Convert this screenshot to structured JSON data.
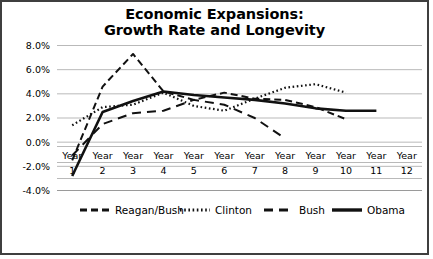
{
  "chart_data": {
    "type": "line",
    "title": "Economic Expansions: Growth Rate and Longevity",
    "title_line1": "Economic Expansions:",
    "title_line2": "Growth Rate and Longevity",
    "xlabel": "",
    "ylabel": "",
    "categories": [
      "Year 1",
      "Year 2",
      "Year 3",
      "Year 4",
      "Year 5",
      "Year 6",
      "Year 7",
      "Year 8",
      "Year 9",
      "Year 10",
      "Year 11",
      "Year 12"
    ],
    "x_tick_words": [
      "Year",
      "Year",
      "Year",
      "Year",
      "Year",
      "Year",
      "Year",
      "Year",
      "Year",
      "Year",
      "Year",
      "Year"
    ],
    "x_tick_numbers": [
      "1",
      "2",
      "3",
      "4",
      "5",
      "6",
      "7",
      "8",
      "9",
      "10",
      "11",
      "12"
    ],
    "ylim": [
      -4.0,
      8.0
    ],
    "ytick_values": [
      8.0,
      6.0,
      4.0,
      2.0,
      0.0,
      -2.0,
      -4.0
    ],
    "ytick_labels": [
      "8.0%",
      "6.0%",
      "4.0%",
      "2.0%",
      "0.0%",
      "-2.0%",
      "-4.0%"
    ],
    "grid": true,
    "legend_position": "bottom",
    "series": [
      {
        "name": "Reagan/Bush",
        "style": "dashed",
        "dash": "7,4",
        "width": 2,
        "x": [
          1,
          2,
          3,
          4,
          5,
          6,
          7,
          8,
          9,
          10
        ],
        "values": [
          -1.5,
          4.6,
          7.3,
          4.2,
          3.5,
          4.1,
          3.6,
          3.5,
          2.9,
          1.9
        ]
      },
      {
        "name": "Clinton",
        "style": "dotted",
        "dash": "1.6,2.6",
        "width": 2.2,
        "x": [
          1,
          2,
          3,
          4,
          5,
          6,
          7,
          8,
          9,
          10
        ],
        "values": [
          1.4,
          2.9,
          3.1,
          4.1,
          3.0,
          2.6,
          3.6,
          4.5,
          4.8,
          4.1
        ]
      },
      {
        "name": "Bush",
        "style": "longdash",
        "dash": "9,6",
        "width": 2,
        "x": [
          1,
          2,
          3,
          4,
          5,
          6,
          7,
          8
        ],
        "values": [
          -1.1,
          1.5,
          2.4,
          2.6,
          3.5,
          3.1,
          2.0,
          0.3
        ]
      },
      {
        "name": "Obama",
        "style": "solid",
        "dash": "",
        "width": 2.6,
        "x": [
          1,
          2,
          3,
          4,
          5,
          6,
          7,
          8,
          9,
          10,
          11
        ],
        "values": [
          -2.8,
          2.5,
          3.4,
          4.2,
          3.9,
          3.7,
          3.5,
          3.2,
          2.8,
          2.6,
          2.6
        ]
      }
    ]
  },
  "legend": {
    "items": [
      {
        "label": "Reagan/Bush"
      },
      {
        "label": "Clinton"
      },
      {
        "label": "Bush"
      },
      {
        "label": "Obama"
      }
    ]
  }
}
